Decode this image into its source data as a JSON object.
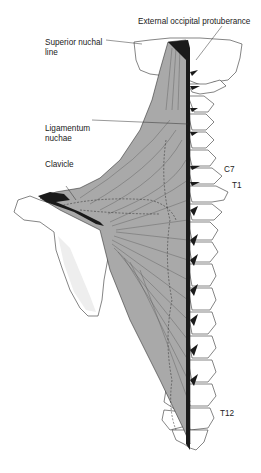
{
  "figure": {
    "colors": {
      "muscle_fill": "#a9a9a9",
      "tendon_dark": "#1a1a1a",
      "bone_fill": "#ffffff",
      "outline": "#333333",
      "label_text": "#222222",
      "background": "#ffffff"
    },
    "labels": {
      "external_occipital_protuberance": "External occipital protuberance",
      "superior_nuchal_line_1": "Superior nuchal",
      "superior_nuchal_line_2": "line",
      "ligamentum_nuchae_1": "Ligamentum",
      "ligamentum_nuchae_2": "nuchae",
      "clavicle": "Clavicle",
      "c7": "C7",
      "t1": "T1",
      "t12": "T12"
    }
  }
}
